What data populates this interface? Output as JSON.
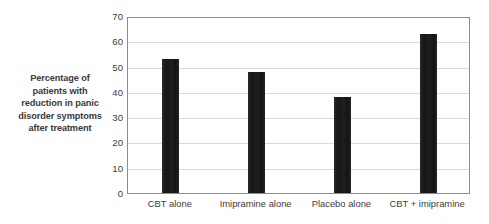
{
  "chart_data": {
    "type": "bar",
    "title": "",
    "xlabel": "",
    "ylabel_lines": [
      "Percentage of",
      "patients with",
      "reduction in panic",
      "disorder symptoms",
      "after treatment"
    ],
    "ylabel": "Percentage of patients with reduction in panic disorder symptoms after treatment",
    "categories": [
      "CBT alone",
      "Imipramine alone",
      "Placebo alone",
      "CBT + imipramine"
    ],
    "values": [
      53,
      48,
      38,
      63
    ],
    "ylim": [
      0,
      70
    ],
    "ytick_values": [
      0,
      10,
      20,
      30,
      40,
      50,
      60,
      70
    ],
    "ytick_labels": [
      "0",
      "10",
      "20",
      "30",
      "40",
      "50",
      "60",
      "70"
    ],
    "grid": true,
    "grid_axis": "y",
    "legend": false,
    "bar_color": "#1c1c1c",
    "grid_color": "#d9d9d9",
    "axes_border_color": "#8c8c8c",
    "background_color": "#ffffff"
  }
}
